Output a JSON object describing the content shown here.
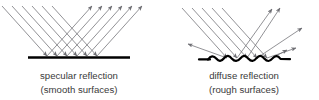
{
  "figure": {
    "title": "",
    "background_color": "#ffffff",
    "ray_color": "#6e6e73",
    "surface_color": "#000000",
    "text_color": "#3a3a3a",
    "panels": [
      {
        "id": "specular",
        "caption_line1": "specular reflection",
        "caption_line2": "(smooth surfaces)",
        "surface_type": "smooth",
        "incoming_ray_count": 6,
        "outgoing_ray_count": 6,
        "incoming_direction": "down-right",
        "outgoing_direction": "up-right"
      },
      {
        "id": "diffuse",
        "caption_line1": "diffuse reflection",
        "caption_line2": "(rough surfaces)",
        "surface_type": "rough",
        "incoming_ray_count": 5,
        "outgoing_ray_count": 6,
        "incoming_direction": "down-right",
        "outgoing_direction": "scattered"
      }
    ]
  }
}
